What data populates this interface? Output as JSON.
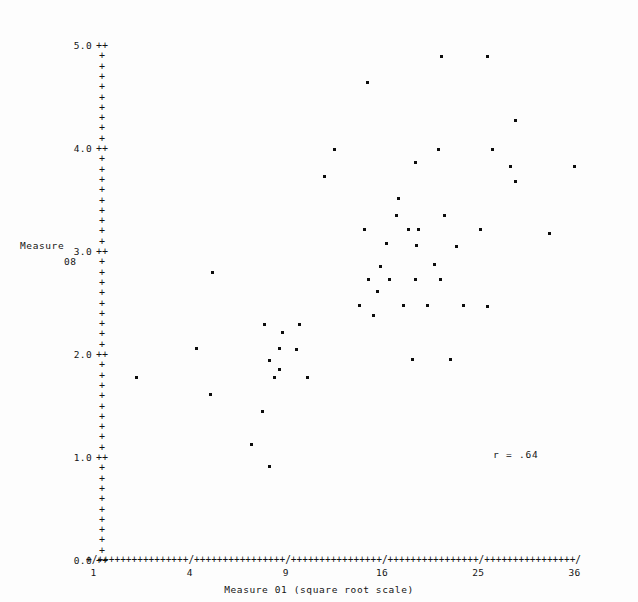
{
  "chart_data": {
    "type": "scatter",
    "title": "",
    "xlabel": "Measure 01 (square root scale)",
    "ylabel_line1": "Measure",
    "ylabel_line2": "08",
    "annotation": "r = .64",
    "correlation": 0.64,
    "grid": false,
    "legend": null,
    "x_scale": "sqrt",
    "y_scale": "linear",
    "xlim": [
      1,
      36
    ],
    "ylim": [
      0.0,
      5.0
    ],
    "x_tick_labels": [
      "1",
      "4",
      "9",
      "16",
      "25",
      "36"
    ],
    "x_tick_values": [
      1,
      4,
      9,
      16,
      25,
      36
    ],
    "y_tick_labels": [
      "5.0",
      "4.0",
      "3.0",
      "2.0",
      "1.0",
      "0.0"
    ],
    "y_tick_values": [
      5.0,
      4.0,
      3.0,
      2.0,
      1.0,
      0.0
    ],
    "y_minor_ticks_per_major": 9,
    "axis_char_vertical": "+",
    "axis_char_horizontal": "+",
    "axis_char_major": "/",
    "point_glyph": "*",
    "points": [
      [
        21.3,
        4.9
      ],
      [
        26.0,
        4.9
      ],
      [
        14.8,
        4.65
      ],
      [
        29.0,
        4.28
      ],
      [
        12.3,
        4.0
      ],
      [
        21.0,
        4.0
      ],
      [
        26.5,
        4.0
      ],
      [
        18.9,
        3.87
      ],
      [
        28.5,
        3.83
      ],
      [
        36.0,
        3.83
      ],
      [
        11.6,
        3.73
      ],
      [
        29.0,
        3.68
      ],
      [
        17.4,
        3.52
      ],
      [
        17.2,
        3.35
      ],
      [
        21.6,
        3.35
      ],
      [
        14.6,
        3.22
      ],
      [
        18.3,
        3.22
      ],
      [
        19.2,
        3.22
      ],
      [
        25.2,
        3.22
      ],
      [
        33.0,
        3.18
      ],
      [
        16.4,
        3.08
      ],
      [
        19.0,
        3.06
      ],
      [
        22.8,
        3.05
      ],
      [
        15.9,
        2.86
      ],
      [
        20.7,
        2.88
      ],
      [
        5.0,
        2.8
      ],
      [
        14.9,
        2.73
      ],
      [
        16.6,
        2.73
      ],
      [
        18.9,
        2.73
      ],
      [
        21.2,
        2.73
      ],
      [
        15.6,
        2.62
      ],
      [
        14.2,
        2.48
      ],
      [
        17.8,
        2.48
      ],
      [
        20.0,
        2.48
      ],
      [
        23.5,
        2.48
      ],
      [
        26.0,
        2.47
      ],
      [
        15.3,
        2.38
      ],
      [
        7.7,
        2.3
      ],
      [
        9.9,
        2.3
      ],
      [
        8.8,
        2.22
      ],
      [
        4.3,
        2.06
      ],
      [
        8.6,
        2.06
      ],
      [
        9.7,
        2.05
      ],
      [
        8.0,
        1.95
      ],
      [
        18.6,
        1.96
      ],
      [
        22.2,
        1.96
      ],
      [
        8.6,
        1.86
      ],
      [
        2.1,
        1.78
      ],
      [
        8.3,
        1.78
      ],
      [
        10.4,
        1.78
      ],
      [
        4.9,
        1.62
      ],
      [
        7.6,
        1.45
      ],
      [
        7.0,
        1.13
      ],
      [
        8.0,
        0.92
      ]
    ]
  },
  "plot_geometry": {
    "x_axis_segments": [
      {
        "lead": "+/",
        "fill_count": 16,
        "terminator": "/"
      },
      {
        "fill_count": 16,
        "terminator": "/"
      },
      {
        "fill_count": 16,
        "terminator": "/"
      },
      {
        "fill_count": 16,
        "terminator": "/"
      },
      {
        "fill_count": 16,
        "terminator": "/"
      }
    ]
  }
}
